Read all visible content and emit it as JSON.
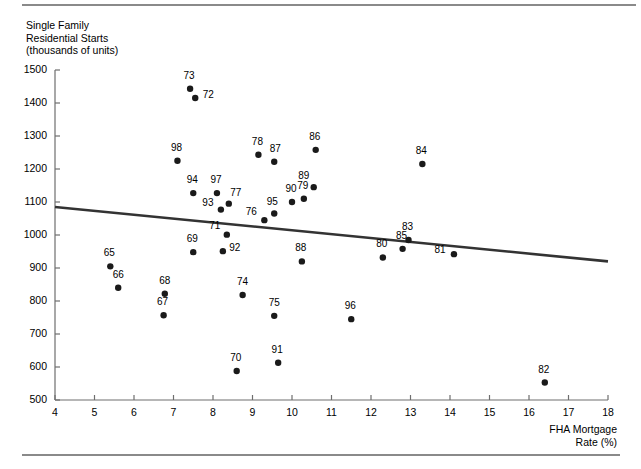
{
  "chart_data": {
    "type": "scatter",
    "title": "",
    "xlabel": "FHA Mortgage Rate (%)",
    "ylabel": "Single Family Residential Starts (thousands of units)",
    "ylabel_lines": [
      "Single Family",
      "Residential Starts",
      "(thousands of units)"
    ],
    "xlabel_lines": [
      "FHA Mortgage",
      "Rate (%)"
    ],
    "xlim": [
      4,
      18
    ],
    "ylim": [
      500,
      1500
    ],
    "xticks": [
      4,
      5,
      6,
      7,
      8,
      9,
      10,
      11,
      12,
      13,
      14,
      15,
      16,
      17,
      18
    ],
    "yticks": [
      500,
      600,
      700,
      800,
      900,
      1000,
      1100,
      1200,
      1300,
      1400,
      1500
    ],
    "grid": false,
    "legend": false,
    "point_color": "#1a1a1a",
    "line_color": "#333333",
    "trendline": {
      "label": "regression-line",
      "x": [
        4,
        18
      ],
      "y": [
        1085,
        920
      ]
    },
    "points": [
      {
        "label": "65",
        "x": 5.4,
        "y": 905,
        "lx": -1,
        "ly": -13
      },
      {
        "label": "66",
        "x": 5.6,
        "y": 840,
        "lx": 0,
        "ly": -13
      },
      {
        "label": "67",
        "x": 6.75,
        "y": 757,
        "lx": -1,
        "ly": -13
      },
      {
        "label": "68",
        "x": 6.78,
        "y": 822,
        "lx": 0,
        "ly": -13
      },
      {
        "label": "69",
        "x": 7.5,
        "y": 948,
        "lx": -1,
        "ly": -13
      },
      {
        "label": "70",
        "x": 8.6,
        "y": 588,
        "lx": -1,
        "ly": -13
      },
      {
        "label": "71",
        "x": 8.35,
        "y": 1001,
        "lx": -12,
        "ly": -9
      },
      {
        "label": "72",
        "x": 7.55,
        "y": 1415,
        "lx": 13,
        "ly": -3
      },
      {
        "label": "73",
        "x": 7.42,
        "y": 1443,
        "lx": -1,
        "ly": -13
      },
      {
        "label": "74",
        "x": 8.75,
        "y": 818,
        "lx": 0,
        "ly": -13
      },
      {
        "label": "75",
        "x": 9.55,
        "y": 755,
        "lx": 0,
        "ly": -13
      },
      {
        "label": "76",
        "x": 9.3,
        "y": 1045,
        "lx": -13,
        "ly": -8
      },
      {
        "label": "77",
        "x": 8.4,
        "y": 1095,
        "lx": 7,
        "ly": -11
      },
      {
        "label": "78",
        "x": 9.15,
        "y": 1243,
        "lx": -1,
        "ly": -13
      },
      {
        "label": "79",
        "x": 10.3,
        "y": 1110,
        "lx": -1,
        "ly": -13
      },
      {
        "label": "80",
        "x": 12.3,
        "y": 932,
        "lx": -1,
        "ly": -13
      },
      {
        "label": "81",
        "x": 14.1,
        "y": 942,
        "lx": -14,
        "ly": -4
      },
      {
        "label": "82",
        "x": 16.4,
        "y": 553,
        "lx": -1,
        "ly": -13
      },
      {
        "label": "83",
        "x": 12.95,
        "y": 985,
        "lx": -1,
        "ly": -13
      },
      {
        "label": "84",
        "x": 13.3,
        "y": 1215,
        "lx": -1,
        "ly": -13
      },
      {
        "label": "85",
        "x": 12.8,
        "y": 958,
        "lx": -1,
        "ly": -13
      },
      {
        "label": "86",
        "x": 10.6,
        "y": 1258,
        "lx": -1,
        "ly": -13
      },
      {
        "label": "87",
        "x": 9.55,
        "y": 1222,
        "lx": 1,
        "ly": -13
      },
      {
        "label": "88",
        "x": 10.25,
        "y": 920,
        "lx": -1,
        "ly": -13
      },
      {
        "label": "89",
        "x": 10.55,
        "y": 1145,
        "lx": -10,
        "ly": -11
      },
      {
        "label": "90",
        "x": 10.0,
        "y": 1100,
        "lx": -1,
        "ly": -13
      },
      {
        "label": "91",
        "x": 9.65,
        "y": 613,
        "lx": -1,
        "ly": -13
      },
      {
        "label": "92",
        "x": 8.25,
        "y": 951,
        "lx": 12,
        "ly": -3
      },
      {
        "label": "93",
        "x": 8.2,
        "y": 1077,
        "lx": -13,
        "ly": -7
      },
      {
        "label": "94",
        "x": 7.5,
        "y": 1127,
        "lx": -1,
        "ly": -13
      },
      {
        "label": "95",
        "x": 9.55,
        "y": 1065,
        "lx": -2,
        "ly": -12
      },
      {
        "label": "96",
        "x": 11.5,
        "y": 745,
        "lx": -1,
        "ly": -13
      },
      {
        "label": "97",
        "x": 8.1,
        "y": 1127,
        "lx": -1,
        "ly": -13
      },
      {
        "label": "98",
        "x": 7.1,
        "y": 1225,
        "lx": -1,
        "ly": -13
      }
    ]
  }
}
